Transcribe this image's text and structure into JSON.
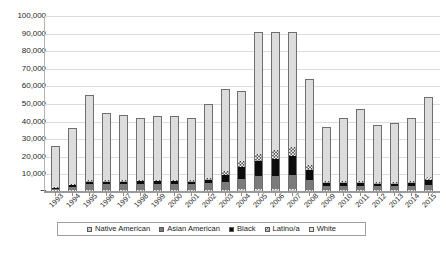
{
  "chart_data": {
    "type": "bar",
    "barmode": "stacked",
    "title": "",
    "subtitle": "",
    "xlabel": "",
    "ylabel": "",
    "ylim": [
      0,
      100000
    ],
    "ytick_step": 10000,
    "grid": true,
    "legend_position": "bottom",
    "ytick_labels": [
      "100,000",
      "90,000",
      "80,000",
      "70,000",
      "60,000",
      "50,000",
      "40,000",
      "30,000",
      "20,000",
      "10,000",
      "–"
    ],
    "ytick_values": [
      100000,
      90000,
      80000,
      70000,
      60000,
      50000,
      40000,
      30000,
      20000,
      10000,
      0
    ],
    "categories": [
      "1993",
      "1994",
      "1995",
      "1996",
      "1997",
      "1998",
      "1999",
      "2000",
      "2001",
      "2002",
      "2003",
      "2004",
      "2005",
      "2006",
      "2007",
      "2008",
      "2009",
      "2010",
      "2011",
      "2012",
      "2013",
      "2014",
      "2015"
    ],
    "series": [
      {
        "name": "Native American",
        "swatch": "light-checkered",
        "color": "#f2f2f2",
        "values": [
          400,
          500,
          600,
          600,
          600,
          600,
          600,
          600,
          600,
          700,
          800,
          900,
          1000,
          1000,
          1000,
          800,
          600,
          600,
          600,
          500,
          500,
          600,
          700
        ]
      },
      {
        "name": "Asian American",
        "swatch": "dark-gray",
        "color": "#7b7b7b",
        "values": [
          800,
          1800,
          3200,
          3300,
          3300,
          3600,
          3600,
          3500,
          3400,
          3900,
          4600,
          6200,
          7600,
          7800,
          8200,
          5300,
          2400,
          2500,
          2300,
          2200,
          2200,
          2400,
          2900
        ]
      },
      {
        "name": "Black",
        "swatch": "solid-black",
        "color": "#0c0c0c",
        "values": [
          700,
          1300,
          1500,
          1500,
          1400,
          1400,
          1400,
          1400,
          1400,
          1800,
          3700,
          6700,
          8500,
          9500,
          10500,
          5700,
          1700,
          1700,
          1700,
          1500,
          1500,
          1700,
          2600
        ]
      },
      {
        "name": "Latino/a",
        "swatch": "white-hatched",
        "color": "#ffffff",
        "values": [
          300,
          500,
          800,
          800,
          800,
          800,
          800,
          800,
          800,
          1100,
          2100,
          3300,
          4200,
          5100,
          5500,
          3000,
          1100,
          1100,
          1100,
          1000,
          1000,
          1100,
          1800
        ]
      },
      {
        "name": "White",
        "swatch": "light-gray",
        "color": "#dcdcdc",
        "values": [
          22800,
          30900,
          48000,
          37700,
          36700,
          34600,
          35700,
          35600,
          34600,
          41500,
          46000,
          39000,
          68600,
          66600,
          64700,
          48400,
          30200,
          35100,
          40600,
          31800,
          32800,
          35200,
          44600
        ]
      }
    ],
    "totals": [
      25000,
      35000,
      54100,
      43900,
      42800,
      41000,
      42100,
      41900,
      40800,
      49000,
      57200,
      56100,
      89900,
      90000,
      89900,
      63200,
      36000,
      41000,
      46300,
      37000,
      38000,
      41000,
      52600
    ]
  },
  "legend": {
    "items": [
      {
        "label": "Native American",
        "swatch_class": "s-native"
      },
      {
        "label": "Asian American",
        "swatch_class": "s-asian"
      },
      {
        "label": "Black",
        "swatch_class": "s-black"
      },
      {
        "label": "Latino/a",
        "swatch_class": "s-latino"
      },
      {
        "label": "White",
        "swatch_class": "s-white"
      }
    ]
  },
  "caption": {
    "text": ""
  }
}
